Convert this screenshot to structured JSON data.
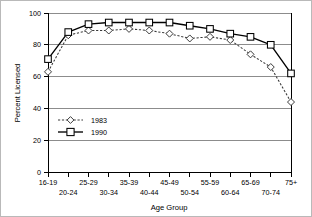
{
  "chart_data": {
    "type": "line",
    "title": "",
    "xlabel": "Age Group",
    "ylabel": "Percent Licensed",
    "categories": [
      "16-19",
      "20-24",
      "25-29",
      "30-34",
      "35-39",
      "40-44",
      "45-49",
      "50-54",
      "55-59",
      "60-64",
      "65-69",
      "70-74",
      "75+"
    ],
    "ylim": [
      0,
      100
    ],
    "yticks": [
      0,
      20,
      40,
      60,
      80,
      100
    ],
    "grid": "horizontal",
    "legend_position": "inside-left",
    "series": [
      {
        "name": "1983",
        "marker": "diamond",
        "line_style": "dashed",
        "values": [
          63,
          86,
          89,
          89,
          90,
          89,
          87,
          84,
          85,
          83,
          74,
          66,
          44
        ]
      },
      {
        "name": "1990",
        "marker": "square",
        "line_style": "solid",
        "values": [
          71,
          88,
          93,
          94,
          94,
          94,
          94,
          92,
          90,
          87,
          85,
          80,
          62
        ]
      }
    ]
  },
  "axes": {
    "y_title": "Percent Licensed",
    "x_title": "Age Group",
    "y_tick_labels": [
      "0",
      "20",
      "40",
      "60",
      "80",
      "100"
    ],
    "x_tick_labels": [
      "16-19",
      "20-24",
      "25-29",
      "30-34",
      "35-39",
      "40-44",
      "45-49",
      "50-54",
      "55-59",
      "60-64",
      "65-69",
      "70-74",
      "75+"
    ]
  },
  "legend": {
    "entries": [
      {
        "label": "1983"
      },
      {
        "label": "1990"
      }
    ]
  },
  "colors": {
    "series_1983": "#3a3a3a",
    "series_1990": "#000000",
    "grid": "#8c8c8c",
    "axis": "#000000",
    "background": "#ffffff",
    "frame": "#b9b9b9"
  }
}
